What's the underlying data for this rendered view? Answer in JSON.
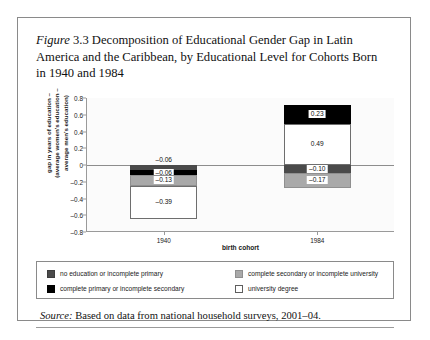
{
  "figure": {
    "label": "Figure",
    "number": "3.3",
    "caption": " Decomposition of Educational Gender Gap in Latin America and the Caribbean, by Educational Level for Cohorts Born in 1940 and 1984"
  },
  "source": {
    "label": "Source:",
    "text": " Based on data from national household surveys, 2001–04."
  },
  "legend": {
    "items": [
      {
        "key": "dgray",
        "label": "no education or incomplete primary",
        "color": "#4a4a4a"
      },
      {
        "key": "lgray",
        "label": "complete secondary or incomplete university",
        "color": "#a9a9a9"
      },
      {
        "key": "black",
        "label": "complete primary or incomplete secondary",
        "color": "#000000"
      },
      {
        "key": "white",
        "label": "university degree",
        "color": "#ffffff"
      }
    ]
  },
  "chart_data": {
    "type": "bar",
    "subtype": "stacked-diverging",
    "title": "Decomposition of Educational Gender Gap in Latin America and the Caribbean, by Educational Level for Cohorts Born in 1940 and 1984",
    "xlabel": "birth cohort",
    "ylabel": "gap in years of education (average women's education – average men's education)",
    "ylabel_line1": "gap in years of education –",
    "ylabel_line2": "(average women's education –",
    "ylabel_line3": "average men's education)",
    "categories": [
      "1940",
      "1984"
    ],
    "ylim": [
      -0.8,
      0.8
    ],
    "yticks": [
      "0.8",
      "0.6",
      "0.4",
      "0.2",
      "0",
      "–0.2",
      "–0.4",
      "–0.6",
      "–0.8"
    ],
    "ytick_values": [
      0.8,
      0.6,
      0.4,
      0.2,
      0,
      -0.2,
      -0.4,
      -0.6,
      -0.8
    ],
    "grid": false,
    "legend_position": "below",
    "series": [
      {
        "name": "no education or incomplete primary",
        "key": "dgray",
        "values": [
          -0.06,
          -0.1
        ]
      },
      {
        "name": "complete primary or incomplete secondary",
        "key": "black",
        "values": [
          -0.06,
          0.23
        ]
      },
      {
        "name": "complete secondary or incomplete university",
        "key": "lgray",
        "values": [
          -0.13,
          -0.17
        ]
      },
      {
        "name": "university degree",
        "key": "white",
        "values": [
          -0.39,
          0.49
        ]
      }
    ],
    "bars": [
      {
        "category": "1940",
        "total": -0.64,
        "segments": [
          {
            "key": "dgray",
            "value": -0.06,
            "label": "–0.06",
            "label_position": "above"
          },
          {
            "key": "black",
            "value": -0.06,
            "label": "–0.06",
            "label_position": "inside"
          },
          {
            "key": "lgray",
            "value": -0.13,
            "label": "–0.13",
            "label_position": "inside"
          },
          {
            "key": "white",
            "value": -0.39,
            "label": "–0.39",
            "label_position": "inside"
          }
        ]
      },
      {
        "category": "1984",
        "total": 0.45,
        "segments": [
          {
            "key": "white",
            "value": 0.49,
            "label": "0.49",
            "label_position": "inside"
          },
          {
            "key": "black",
            "value": 0.23,
            "label": "0.23",
            "label_position": "inside"
          },
          {
            "key": "dgray",
            "value": -0.1,
            "label": "–0.10",
            "label_position": "inside"
          },
          {
            "key": "lgray",
            "value": -0.17,
            "label": "–0.17",
            "label_position": "inside"
          }
        ]
      }
    ]
  }
}
